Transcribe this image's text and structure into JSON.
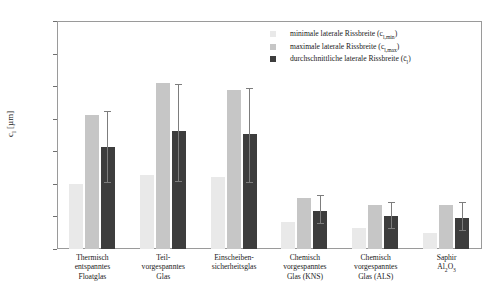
{
  "chart_data": {
    "type": "bar",
    "title": "",
    "xlabel": "",
    "ylabel": "cₗ [µm]",
    "ylim": [
      0,
      350
    ],
    "yticks": [
      0,
      50,
      100,
      150,
      200,
      250,
      300,
      350
    ],
    "grid": false,
    "legend_position": "top-right",
    "categories": [
      "Thermisch entspanntes Floatglas",
      "Teil-vorgespanntes Glas",
      "Einscheiben-sicherheitsglas",
      "Chemisch vorgespanntes Glas (KNS)",
      "Chemisch vorgespanntes Glas (ALS)",
      "Saphir Al₂O₃"
    ],
    "category_lines": [
      [
        "Thermisch",
        "entspanntes",
        "Floatglas"
      ],
      [
        "Teil-",
        "vorgespanntes",
        "Glas"
      ],
      [
        "Einscheiben-",
        "sicherheitsglas"
      ],
      [
        "Chemisch",
        "vorgespanntes",
        "Glas (KNS)"
      ],
      [
        "Chemisch",
        "vorgespanntes",
        "Glas (ALS)"
      ],
      [
        "Saphir",
        "Al₂O₃"
      ]
    ],
    "series": [
      {
        "name": "minimale laterale Rissbreite (cₗ,min)",
        "color": "#e9e9e9",
        "values": [
          100,
          113,
          110,
          41,
          33,
          25
        ]
      },
      {
        "name": "maximale laterale Rissbreite (cₗ,max)",
        "color": "#c6c6c6",
        "values": [
          205,
          255,
          244,
          79,
          68,
          68
        ]
      },
      {
        "name": "durchschnittliche laterale Rissbreite (c̄ₗ)",
        "color": "#3d3d3d",
        "values": [
          156,
          181,
          177,
          58,
          50,
          47
        ],
        "err_low": [
          102,
          103,
          101,
          38,
          31,
          27
        ],
        "err_high": [
          210,
          252,
          245,
          82,
          70,
          70
        ]
      }
    ]
  },
  "legend": {
    "items": [
      {
        "label_main": "minimale laterale Rissbreite (c",
        "label_sub": "l,min",
        "label_tail": ")",
        "color": "#e9e9e9"
      },
      {
        "label_main": "maximale laterale Rissbreite (c",
        "label_sub": "l,max",
        "label_tail": ")",
        "color": "#c6c6c6"
      },
      {
        "label_main": "durchschnittliche laterale Rissbreite (c̄",
        "label_sub": "l",
        "label_tail": ")",
        "color": "#3d3d3d"
      }
    ]
  },
  "axis": {
    "y_title_main": "c",
    "y_title_sub": "l",
    "y_title_unit": " [µm]",
    "ytick_labels": [
      "0",
      "50",
      "100",
      "150",
      "200",
      "250",
      "300",
      "350"
    ]
  }
}
